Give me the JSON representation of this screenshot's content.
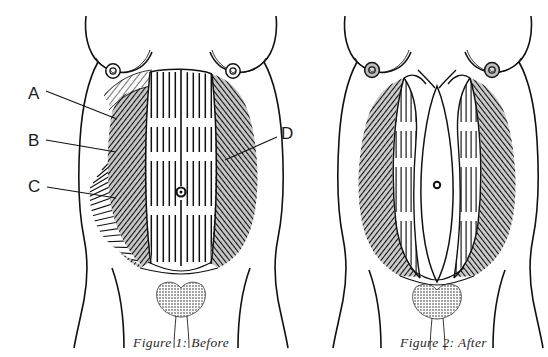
{
  "figure_set": {
    "background_color": "#ffffff",
    "ink_color": "#111111",
    "width": 548,
    "height": 357,
    "subject": "female-torso-abdominal-muscles"
  },
  "figures": [
    {
      "id": "figure-1",
      "caption": "Figure 1: Before",
      "caption_x": 133,
      "caption_y": 347,
      "center_x": 181,
      "condition": "intact-abdominal-wall",
      "navel_x": 181,
      "navel_y": 192
    },
    {
      "id": "figure-2",
      "caption": "Figure 2: After",
      "caption_x": 400,
      "caption_y": 347,
      "center_x": 437,
      "condition": "separated-rectus-abdominis-diastasis",
      "navel_x": 437,
      "navel_y": 185
    }
  ],
  "labels": [
    {
      "key": "A",
      "text": "A",
      "text_x": 28,
      "text_y": 99,
      "leader_from_x": 46,
      "leader_from_y": 91,
      "leader_to_x": 117,
      "leader_to_y": 119
    },
    {
      "key": "B",
      "text": "B",
      "text_x": 28,
      "text_y": 146,
      "leader_from_x": 46,
      "leader_from_y": 140,
      "leader_to_x": 116,
      "leader_to_y": 152
    },
    {
      "key": "C",
      "text": "C",
      "text_x": 28,
      "text_y": 192,
      "leader_from_x": 47,
      "leader_from_y": 187,
      "leader_to_x": 116,
      "leader_to_y": 198
    },
    {
      "key": "D",
      "text": "D",
      "text_x": 281,
      "text_y": 139,
      "leader_from_x": 277,
      "leader_from_y": 137,
      "leader_to_x": 225,
      "leader_to_y": 160
    }
  ]
}
